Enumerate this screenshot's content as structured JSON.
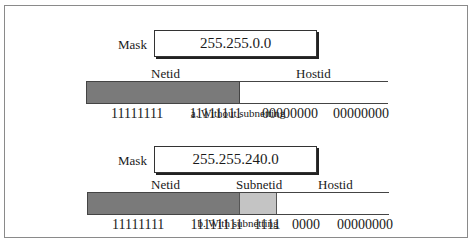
{
  "diagram": {
    "part_a": {
      "mask_label": "Mask",
      "mask_value": "255.255.0.0",
      "headers": {
        "netid": "Netid",
        "hostid": "Hostid"
      },
      "bits": {
        "net1": "11111111",
        "net2": "11111111",
        "host1": "00000000",
        "host2": "00000000"
      },
      "caption": "a. Without subnetting"
    },
    "part_b": {
      "mask_label": "Mask",
      "mask_value": "255.255.240.0",
      "headers": {
        "netid": "Netid",
        "subnetid": "Subnetid",
        "hostid": "Hostid"
      },
      "bits": {
        "net1": "11111111",
        "net2": "11111111",
        "subnet": "1111",
        "host_a": "0000",
        "host2": "00000000"
      },
      "caption": "b. With subnetting"
    },
    "colors": {
      "netid": "#7a7a7a",
      "subnetid": "#c4c4c4",
      "hostid": "#ffffff",
      "border": "#8a8a8a"
    }
  }
}
